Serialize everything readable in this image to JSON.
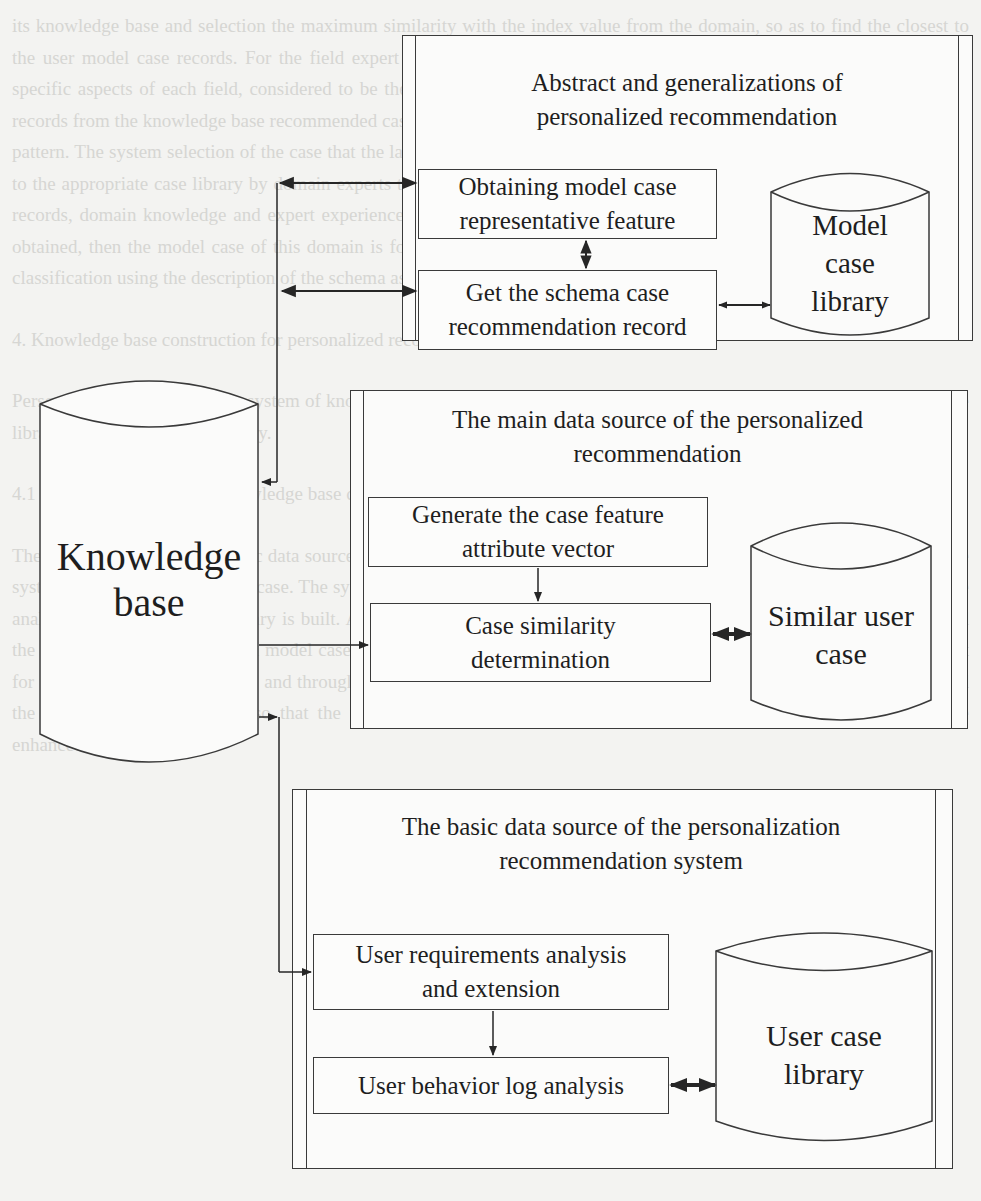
{
  "diagram": {
    "type": "flowchart",
    "knowledge_base": {
      "label_line1": "Knowledge",
      "label_line2": "base"
    },
    "panels": [
      {
        "id": "abstract",
        "title_line1": "Abstract and generalizations of",
        "title_line2": "personalized recommendation",
        "boxes": [
          {
            "line1": "Obtaining model case",
            "line2": "representative feature"
          },
          {
            "line1": "Get the schema case",
            "line2": "recommendation record"
          }
        ],
        "store": {
          "line1": "Model",
          "line2": "case",
          "line3": "library"
        }
      },
      {
        "id": "main-source",
        "title_line1": "The main data source of the personalized",
        "title_line2": "recommendation",
        "boxes": [
          {
            "line1": "Generate the case feature",
            "line2": "attribute vector"
          },
          {
            "line1": "Case similarity",
            "line2": "determination"
          }
        ],
        "store": {
          "line1": "Similar user",
          "line2": "case"
        }
      },
      {
        "id": "basic-source",
        "title_line1": "The basic data source of the personalization",
        "title_line2": "recommendation system",
        "boxes": [
          {
            "line1": "User requirements analysis",
            "line2": "and extension"
          },
          {
            "line1": "User behavior log analysis"
          }
        ],
        "store": {
          "line1": "User case",
          "line2": "library"
        }
      }
    ],
    "connections": [
      {
        "from": "Knowledge base",
        "to": "Obtaining model case representative feature",
        "style": "bidirectional"
      },
      {
        "from": "Knowledge base",
        "to": "Get the schema case recommendation record",
        "style": "bidirectional"
      },
      {
        "from": "Obtaining model case representative feature",
        "to": "Get the schema case recommendation record",
        "style": "bidirectional"
      },
      {
        "from": "Get the schema case recommendation record",
        "to": "Model case library",
        "style": "bidirectional"
      },
      {
        "from": "Knowledge base",
        "to": "Case similarity determination",
        "style": "arrow"
      },
      {
        "from": "Generate the case feature attribute vector",
        "to": "Case similarity determination",
        "style": "arrow"
      },
      {
        "from": "Case similarity determination",
        "to": "Similar user case",
        "style": "bidirectional-thick"
      },
      {
        "from": "Knowledge base",
        "to": "User requirements analysis and extension",
        "style": "bidirectional"
      },
      {
        "from": "User requirements analysis and extension",
        "to": "User behavior log analysis",
        "style": "arrow"
      },
      {
        "from": "User behavior log analysis",
        "to": "User case library",
        "style": "bidirectional-thick"
      }
    ]
  },
  "background_text": {
    "p1": "its knowledge base and selection the maximum similarity with the index value from the domain, so as to find the closest to the user model case records. For the field expert and domain experts, the case is the representative of the pattern of the specific aspects of each field, considered to be the most representative of the domain to the field. World Knowledge Base records from the knowledge base recommended case, to the behavior and degree of similarity of the case records and the user pattern. The system selection of the case that the largest similarity with the user is the recommended case, and then classifies to the appropriate case library by domain experts to find the template. The template matching uses the attributes of the case records, domain knowledge and expert experience to develop the rule set and then the specific recommendation pattern is obtained, then the model case of this domain is formed, and the model case library of the domain is the main user pattern classification using the description of the schema as the knowledge.",
    "heading": "4. Knowledge base construction for personalized recommendation system",
    "p2": "Personalized recommendation system of knowledge base construction mainly includes the user case library, similar user case library and the model case library.",
    "p3": "4.1 The significance of the knowledge base construction",
    "p4": "The user case library is the basic data source of the knowledge base, and the information of user preferences collected by the system is the source of the user case. The system analyses the user requirements and extends them, the user behavior logs are analyzed and the user case library is built. According to the user's needs and preferences, the relevant data is obtained, and the similar user case library and model case library are constructed. The knowledge base construction provides data support for the recommendation system, and through continuous learning, the system improves the accuracy of recommendation and the efficiency of the service, so that the user experience and the satisfaction of the personalized recommendation are enhanced."
  }
}
